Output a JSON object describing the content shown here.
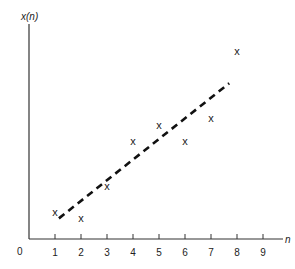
{
  "chart_data": {
    "type": "scatter",
    "title": "",
    "xlabel": "n",
    "ylabel": "x(n)",
    "origin_label": "0",
    "x_ticks": [
      1,
      2,
      3,
      4,
      5,
      6,
      7,
      8,
      9
    ],
    "xlim": [
      0,
      9.7
    ],
    "y_ticks": [],
    "grid": false,
    "legend": null,
    "marker": "x",
    "series": [
      {
        "name": "x(n) samples",
        "type": "scatter",
        "x": [
          1,
          2,
          3,
          4,
          5,
          6,
          7,
          8
        ],
        "y": [
          1.2,
          0.9,
          2.3,
          4.3,
          5.0,
          4.3,
          5.3,
          8.2
        ]
      },
      {
        "name": "linear fit",
        "type": "line",
        "style": "dashed",
        "x": [
          1.15,
          7.7
        ],
        "y": [
          0.9,
          6.8
        ]
      }
    ],
    "ylim": [
      0,
      9.4
    ]
  },
  "labels": {
    "ylabel": "x(n)",
    "xlabel": "n",
    "origin": "0",
    "ticks": [
      "1",
      "2",
      "3",
      "4",
      "5",
      "6",
      "7",
      "8",
      "9"
    ],
    "marker": "x"
  }
}
